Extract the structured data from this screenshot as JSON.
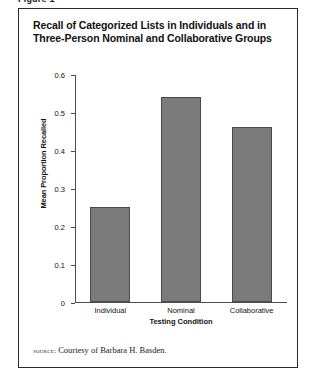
{
  "figure": {
    "caption_fragment": "Figure 1",
    "title": "Recall of Categorized Lists in Individuals and in Three-Person Nominal and Collaborative Groups",
    "source_word": "source:",
    "source_text": "Courtesy of Barbara H. Basden."
  },
  "chart_data": {
    "type": "bar",
    "title": "Recall of Categorized Lists in Individuals and in Three-Person Nominal and Collaborative Groups",
    "categories": [
      "Individual",
      "Nominal",
      "Collaborative"
    ],
    "values": [
      0.25,
      0.54,
      0.46
    ],
    "xlabel": "Testing Condition",
    "ylabel": "Mean Proportion Recalled",
    "ylim": [
      0,
      0.6
    ],
    "ytick_labels": [
      "0.6",
      "0.5",
      "0.4",
      "0.3",
      "0.2",
      "0.1",
      "0"
    ],
    "ytick_values": [
      0.6,
      0.5,
      0.4,
      0.3,
      0.2,
      0.1,
      0
    ],
    "grid": false,
    "legend": false,
    "bar_color": "#7b7b7b",
    "bar_border_color": "#4a4a4a",
    "axis_color": "#4d4d4d"
  }
}
